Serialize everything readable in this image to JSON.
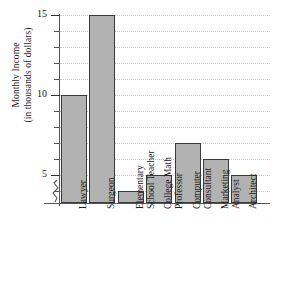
{
  "chart_data": {
    "type": "bar",
    "title": "",
    "xlabel": "",
    "ylabel": "Monthly Income (in thousands of dollars)",
    "ylabel_lines": [
      "Monthly Income",
      "(in thousands of dollars)"
    ],
    "categories": [
      "Lawyer",
      "Surgeon",
      "Elementary School Teacher",
      "College Math Professor",
      "Computer Consultant",
      "Marketing Analyst",
      "Architect"
    ],
    "category_lines": [
      [
        "Lawyer"
      ],
      [
        "Surgeon"
      ],
      [
        "Elementary",
        "School Teacher"
      ],
      [
        "College Math",
        "Professor"
      ],
      [
        "Computer",
        "Consultant"
      ],
      [
        "Marketing",
        "Analyst"
      ],
      [
        "Architect"
      ]
    ],
    "values": [
      10,
      15,
      4,
      5,
      7,
      6,
      5
    ],
    "ylim": [
      3,
      15
    ],
    "ytick_labels": [
      "15",
      "10",
      "5"
    ],
    "ytick_values": [
      15,
      10,
      5
    ],
    "minor_tick_values": [
      14,
      13,
      12,
      11,
      9,
      8,
      7,
      6,
      4
    ],
    "grid": true,
    "grid_values": [
      15,
      14,
      13,
      12,
      11,
      10,
      9,
      8,
      7,
      6,
      5,
      4
    ],
    "axis_break": true,
    "axis_break_note": "zigzag break on y-axis below 5",
    "legend": null,
    "bar_fill_color": "#b2b2b2",
    "bar_edge_color": "#3a3a3a",
    "grid_color": "#c9c9c9",
    "axis_color": "#555555",
    "background_color": "#ffffff"
  }
}
